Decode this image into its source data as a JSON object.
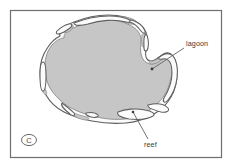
{
  "figure": {
    "name": "atoll-cross-section-map",
    "panel_letter": "C",
    "background_color": "#ffffff",
    "frame": {
      "name": "figure-frame",
      "stroke_color": "#6e6e6e",
      "x": 10,
      "y": 10,
      "width": 211,
      "height": 147
    },
    "lagoon": {
      "label": "lagoon",
      "fill_color": "#c6c6c6",
      "stroke_color": "#7d7d7d"
    },
    "reef": {
      "label": "reef",
      "fill_color": "#fbfbfb",
      "stroke_color": "#5f5f5f"
    },
    "annotations": [
      {
        "id": "lagoon",
        "label": "lagoon",
        "text_x": 186,
        "text_y": 46,
        "leader_from_x": 184,
        "leader_from_y": 48,
        "leader_to_x": 152,
        "leader_to_y": 69
      },
      {
        "id": "reef",
        "label": "reef",
        "text_x": 145,
        "text_y": 146,
        "leader_from_x": 148,
        "leader_from_y": 139,
        "leader_to_x": 133,
        "leader_to_y": 112
      }
    ]
  }
}
